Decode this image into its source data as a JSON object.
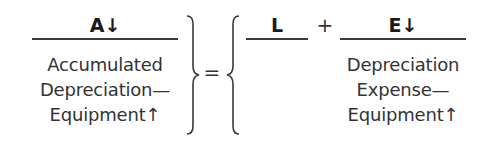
{
  "equation": {
    "assets": {
      "label": "A↓",
      "lines": [
        "Accumulated",
        "Depreciation—",
        "Equipment↑"
      ]
    },
    "equals": "=",
    "liabilities": {
      "label": "L"
    },
    "plus": "+",
    "equity": {
      "label": "E↓",
      "lines": [
        "Depreciation",
        "Expense—",
        "Equipment↑"
      ]
    }
  }
}
